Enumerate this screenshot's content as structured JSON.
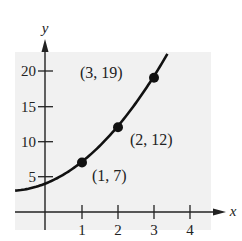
{
  "chart_data": {
    "type": "line",
    "title": "",
    "xlabel": "x",
    "ylabel": "y",
    "xlim": [
      -0.83,
      4.8
    ],
    "ylim": [
      0,
      22.5
    ],
    "x_ticks": [
      1,
      2,
      3,
      4
    ],
    "y_ticks": [
      5,
      10,
      15,
      20
    ],
    "grid": false,
    "background": "#f1f1f1",
    "curve": {
      "equation": "y = x^2 + 2x + 4",
      "x_range": [
        -0.83,
        3.4
      ],
      "color": "#111111"
    },
    "points": [
      {
        "x": 1,
        "y": 7,
        "label": "(1, 7)"
      },
      {
        "x": 2,
        "y": 12,
        "label": "(2, 12)"
      },
      {
        "x": 3,
        "y": 19,
        "label": "(3, 19)"
      }
    ]
  },
  "labels": {
    "x_axis": "x",
    "y_axis": "y",
    "x_ticks": [
      "1",
      "2",
      "3",
      "4"
    ],
    "y_ticks": [
      "5",
      "10",
      "15",
      "20"
    ],
    "p1": "(1, 7)",
    "p2": "(2, 12)",
    "p3": "(3, 19)"
  }
}
